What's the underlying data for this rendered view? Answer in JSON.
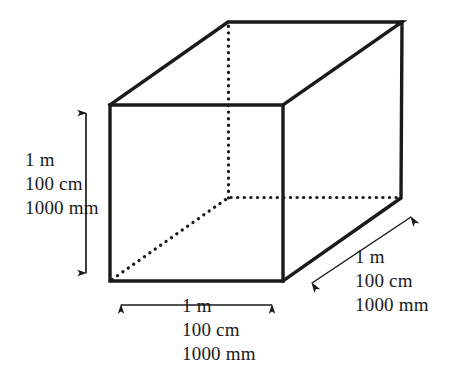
{
  "figure": {
    "background_color": "#ffffff",
    "stroke_color": "#1a1a1a",
    "text_color": "#1a1a1a",
    "width": 453,
    "height": 383
  },
  "dimensions": {
    "height_label": {
      "name": "height-dimension",
      "lines": [
        "1 m",
        "100 cm",
        "1000 mm"
      ],
      "line1": "1 m",
      "line2": "100 cm",
      "line3": "1000 mm"
    },
    "width_label": {
      "name": "width-dimension",
      "lines": [
        "1 m",
        "100 cm",
        "1000 mm"
      ],
      "line1": "1 m",
      "line2": "100 cm",
      "line3": "1000 mm"
    },
    "depth_label": {
      "name": "depth-dimension",
      "lines": [
        "1 m",
        "100 cm",
        "1000 mm"
      ],
      "line1": "1 m",
      "line2": "100 cm",
      "line3": "1000 mm"
    }
  },
  "geometry": {
    "front_face": {
      "top_left": [
        110,
        105
      ],
      "top_right": [
        283,
        105
      ],
      "bottom_right": [
        283,
        281
      ],
      "bottom_left": [
        110,
        281
      ]
    },
    "back_face": {
      "top_left": [
        228,
        22
      ],
      "top_right": [
        402,
        22
      ],
      "bottom_right": [
        401,
        198
      ],
      "bottom_left": [
        229,
        198
      ]
    },
    "hidden_edges": [
      "back-bottom-left to front-bottom-left",
      "back-bottom-left to back-top-left",
      "back-bottom-left to back-bottom-right"
    ]
  },
  "arrows": {
    "height_arrow": {
      "from": [
        86,
        105
      ],
      "to": [
        86,
        281
      ],
      "double_headed": true
    },
    "width_arrow": {
      "from": [
        113,
        305
      ],
      "to": [
        280,
        305
      ],
      "double_headed": true
    },
    "depth_arrow": {
      "from": [
        305,
        288
      ],
      "to": [
        418,
        212
      ],
      "double_headed": true
    }
  }
}
